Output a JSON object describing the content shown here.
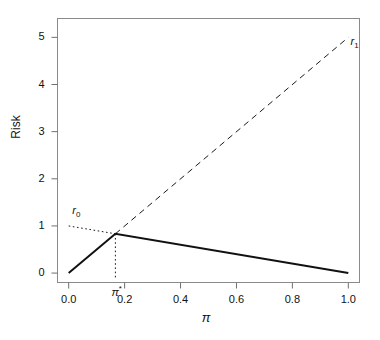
{
  "chart_data": {
    "type": "line",
    "title": "",
    "xlabel": "π",
    "ylabel": "Risk",
    "xlim": [
      -0.04,
      1.04
    ],
    "ylim": [
      -0.2,
      5.4
    ],
    "grid": false,
    "legend_position": "inline-annotations",
    "xticks": [
      "0.0",
      "0.2",
      "0.4",
      "0.6",
      "0.8",
      "1.0"
    ],
    "xtick_values": [
      0.0,
      0.2,
      0.4,
      0.6,
      0.8,
      1.0
    ],
    "yticks": [
      "0",
      "1",
      "2",
      "3",
      "4",
      "5"
    ],
    "ytick_values": [
      0,
      1,
      2,
      3,
      4,
      5
    ],
    "series": [
      {
        "name": "r0",
        "label": "r",
        "label_sub": "0",
        "style": "dotted",
        "color": "#1a1a1a",
        "width": 1,
        "points": [
          [
            0.0,
            1.0
          ],
          [
            1.0,
            0.0
          ]
        ],
        "visible_segment": [
          [
            0.0,
            1.0
          ],
          [
            0.167,
            0.833
          ]
        ],
        "label_x": 0.02,
        "label_y": 1.32
      },
      {
        "name": "r1",
        "label": "r",
        "label_sub": "1",
        "style": "dashed",
        "color": "#1a1a1a",
        "width": 1,
        "points": [
          [
            0.0,
            0.0
          ],
          [
            1.0,
            5.0
          ]
        ],
        "visible_segment": [
          [
            0.167,
            0.833
          ],
          [
            1.0,
            5.0
          ]
        ],
        "label_x": 1.015,
        "label_y": 4.9
      },
      {
        "name": "bayes-risk-envelope",
        "label": "",
        "style": "solid",
        "color": "#111111",
        "width": 2,
        "points": [
          [
            0.0,
            0.0
          ],
          [
            0.167,
            0.833
          ],
          [
            1.0,
            0.0
          ]
        ]
      }
    ],
    "annotations": [
      {
        "name": "pi-star",
        "label": "π",
        "superscript": "*",
        "x": 0.167,
        "y": -0.38,
        "drop_line_from_y": 0.833,
        "drop_line_to_y": -0.12,
        "style": "dotted"
      }
    ]
  },
  "axes": {
    "ylabel": "Risk",
    "xlabel": "π"
  }
}
